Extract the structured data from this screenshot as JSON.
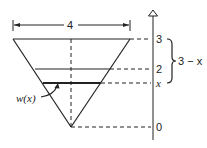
{
  "diagram": {
    "type": "inverted-triangle-tank-cross-section",
    "dimension": {
      "label": "4"
    },
    "axis": {
      "ticks": [
        {
          "label": "3",
          "value": 3
        },
        {
          "label": "2",
          "value": 2
        },
        {
          "label": "x",
          "value": "x"
        },
        {
          "label": "0",
          "value": 0
        }
      ]
    },
    "brace": {
      "label": "3 − x"
    },
    "width_label": "w(x)",
    "colors": {
      "stroke": "#222222",
      "background": "#ffffff"
    }
  }
}
